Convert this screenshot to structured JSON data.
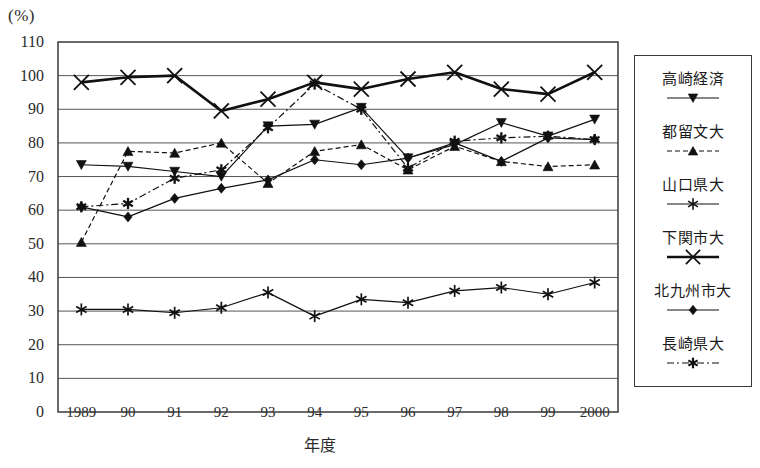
{
  "figure": {
    "unit_label": "(%)",
    "xaxis_title": "年度"
  },
  "legend": {
    "items": [
      {
        "label": "高崎経済",
        "marker": "triangle-down-icon",
        "dash": "none"
      },
      {
        "label": "都留文大",
        "marker": "triangle-up-icon",
        "dash": "dashed"
      },
      {
        "label": "山口県大",
        "marker": "asterisk-icon",
        "dash": "none"
      },
      {
        "label": "下関市大",
        "marker": "cross-x-icon",
        "dash": "none"
      },
      {
        "label": "北九州市大",
        "marker": "diamond-icon",
        "dash": "none"
      },
      {
        "label": "長崎県大",
        "marker": "star-burst-icon",
        "dash": "dashdot"
      }
    ]
  },
  "chart_data": {
    "type": "line",
    "title": "",
    "xlabel": "年度",
    "ylabel": "(%)",
    "ylim": [
      0,
      110
    ],
    "ytick_step": 10,
    "yticks": [
      110,
      100,
      90,
      80,
      70,
      60,
      50,
      40,
      30,
      20,
      10,
      0
    ],
    "grid": true,
    "legend_position": "right",
    "categories": [
      "1989",
      "90",
      "91",
      "92",
      "93",
      "94",
      "95",
      "96",
      "97",
      "98",
      "99",
      "2000"
    ],
    "series": [
      {
        "name": "高崎経済",
        "marker": "triangle-down",
        "linestyle": "solid",
        "values": [
          73.5,
          73,
          71.5,
          70,
          85,
          85.5,
          90.5,
          75.5,
          79.5,
          86,
          82,
          87
        ]
      },
      {
        "name": "都留文大",
        "marker": "triangle-up",
        "linestyle": "dashed",
        "values": [
          50.5,
          77.5,
          77,
          80,
          68,
          77.5,
          79.5,
          72,
          79,
          74.5,
          73,
          73.5
        ]
      },
      {
        "name": "山口県大",
        "marker": "asterisk",
        "linestyle": "solid",
        "values": [
          30.5,
          30.5,
          29.5,
          31,
          35.5,
          28.5,
          33.5,
          32.5,
          36,
          37,
          35,
          38.5
        ]
      },
      {
        "name": "下関市大",
        "marker": "cross-x",
        "linestyle": "solid",
        "values": [
          98,
          99.5,
          100,
          89.5,
          93,
          98,
          96,
          99,
          101,
          96,
          94.5,
          101
        ]
      },
      {
        "name": "北九州市大",
        "marker": "diamond",
        "linestyle": "solid",
        "values": [
          61,
          58,
          63.5,
          66.5,
          69,
          75,
          73.5,
          75.5,
          80,
          74.5,
          81.5,
          81
        ]
      },
      {
        "name": "長崎県大",
        "marker": "star-burst",
        "linestyle": "dashdot",
        "values": [
          61,
          62,
          69.5,
          72,
          84.5,
          97.5,
          90,
          72.5,
          80.5,
          81.5,
          82,
          81
        ]
      }
    ]
  }
}
